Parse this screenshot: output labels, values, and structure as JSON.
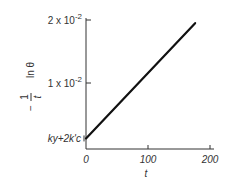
{
  "chart_data": {
    "type": "line",
    "title": "",
    "xlabel": "t",
    "ylabel": "-(1/t) ln θ",
    "ylabel_parts": {
      "minus": "−",
      "numerator": "1",
      "denominator": "t",
      "func": "ln θ"
    },
    "xlim": [
      0,
      200
    ],
    "ylim": [
      0,
      0.02
    ],
    "x_ticks": [
      {
        "value": 0,
        "label": "0"
      },
      {
        "value": 100,
        "label": "100"
      },
      {
        "value": 200,
        "label": "200"
      }
    ],
    "y_ticks": [
      {
        "value": 0.01,
        "label_base": "1 x 10",
        "label_exp": "-2"
      },
      {
        "value": 0.02,
        "label_base": "2 x 10",
        "label_exp": "-2"
      }
    ],
    "annotations": [
      {
        "text": "ky+2k'c",
        "x": 0,
        "y": 0.0012,
        "position": "left-of-axis"
      }
    ],
    "grid": false,
    "series": [
      {
        "name": "line",
        "x": [
          0,
          176
        ],
        "y": [
          0.0012,
          0.0195
        ]
      }
    ]
  }
}
